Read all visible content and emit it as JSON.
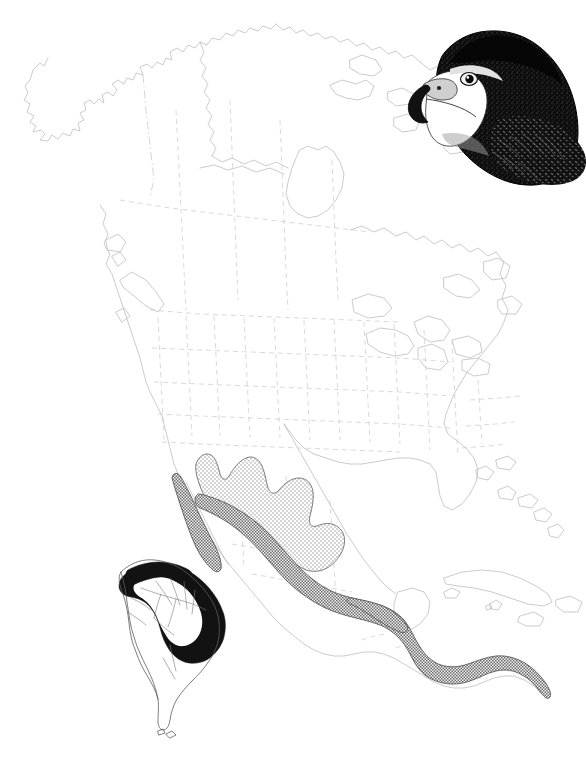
{
  "plate": {
    "kind": "species-distribution-range-map",
    "background_color": "#ffffff",
    "width": 586,
    "height": 759,
    "caption": "",
    "title": ""
  },
  "illustration": {
    "subject": "hawk-head",
    "name": "bird-of-prey-head-illustration",
    "description": "Ink-stipple head-and-shoulders portrait of a dark hawk facing left, pale cheek and throat, hooked beak",
    "position": "top-right",
    "plumage_color": "#101010",
    "highlight_color": "#ffffff",
    "beak_color": "#1a1a1a"
  },
  "map": {
    "name": "north-and-central-america-base-map",
    "region": "North America, Central America, Caribbean",
    "coastline_color": "#b9b9b9",
    "internal_border_color": "#c9c9c9",
    "internal_border_style": "dashed",
    "landmasses": [
      "Alaska",
      "Canada",
      "Greenland edge",
      "United States",
      "Mexico",
      "Central America",
      "Cuba",
      "Hispaniola",
      "Jamaica",
      "Bahamas",
      "Baja California",
      "Vancouver Island",
      "Newfoundland",
      "Great Lakes"
    ]
  },
  "legend": {
    "name": "range-shading-classes",
    "classes": [
      {
        "id": "light-hatch",
        "label": "Breeding / northern range",
        "pattern": "fine light crosshatch",
        "fill_color": "#e8e8e8",
        "dot_color": "#9a9a9a",
        "outline_color": "#6f6f6f",
        "extent": "northern and north-central Mexico, southwestern United States border"
      },
      {
        "id": "dense-stipple",
        "label": "Resident / southern range",
        "pattern": "dense stipple",
        "fill_color": "#bdbdbd",
        "dot_color": "#4a4a4a",
        "outline_color": "#5a5a5a",
        "extent": "Baja California, southern Mexico, Yucatan, Central America to Panama"
      },
      {
        "id": "solid-black",
        "label": "South American range",
        "pattern": "solid fill",
        "fill_color": "#121212",
        "extent": "northern South America, Guianas, eastern and coastal Brazil"
      }
    ]
  },
  "inset": {
    "name": "south-america-inset",
    "region": "South America",
    "coastline_color": "#5d5d5d",
    "river_color": "#7a7a7a",
    "position": "lower-left",
    "range_fill": "#121212"
  }
}
